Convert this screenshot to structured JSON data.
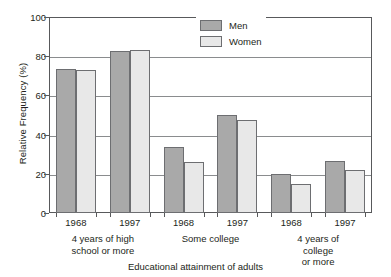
{
  "chart_data": {
    "type": "bar",
    "title": "",
    "xlabel": "Educational attainment of adults",
    "ylabel": "Relative Frequency (%)",
    "ylim": [
      0,
      100
    ],
    "yticks": [
      0,
      20,
      40,
      60,
      80,
      100
    ],
    "grid": "horizontal",
    "legend_position": "top-center",
    "categories": [
      "4 years of high\nschool or more — 1968",
      "4 years of high\nschool or more — 1997",
      "Some college — 1968",
      "Some college — 1997",
      "4 years of college\nor more — 1968",
      "4 years of college\nor more — 1997"
    ],
    "groups": [
      {
        "label": "4 years of high\nschool or more",
        "years": [
          "1968",
          "1997"
        ]
      },
      {
        "label": "Some college",
        "years": [
          "1968",
          "1997"
        ]
      },
      {
        "label": "4 years of college\nor more",
        "years": [
          "1968",
          "1997"
        ]
      }
    ],
    "series": [
      {
        "name": "Men",
        "color": "#a9a9a9",
        "values": [
          73.5,
          82.5,
          33.5,
          50.0,
          20.0,
          26.5
        ]
      },
      {
        "name": "Women",
        "color": "#e8e8e8",
        "values": [
          73.0,
          83.0,
          26.0,
          47.5,
          15.0,
          22.0
        ]
      }
    ]
  },
  "legend": {
    "items": [
      {
        "label": "Men"
      },
      {
        "label": "Women"
      }
    ]
  },
  "axes": {
    "y_title": "Relative Frequency (%)",
    "x_title": "Educational attainment of adults",
    "y_tick_labels": [
      "0",
      "20",
      "40",
      "60",
      "80",
      "100"
    ]
  },
  "x_year_labels": [
    "1968",
    "1997",
    "1968",
    "1997",
    "1968",
    "1997"
  ],
  "x_group_labels": [
    "4 years of high\nschool or more",
    "Some college",
    "4 years of college\nor more"
  ]
}
